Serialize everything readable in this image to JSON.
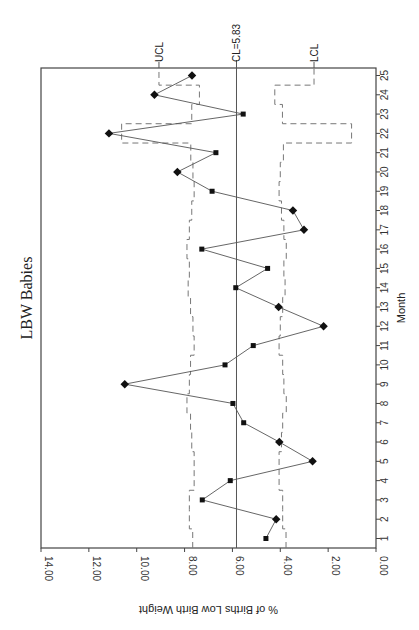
{
  "chart_data": {
    "type": "line",
    "subtype": "p-chart control chart (rotated 90 degrees)",
    "title": "LBW Babies",
    "xlabel": "Month",
    "ylabel": "% of Births Low Birth Weight",
    "x": [
      1,
      2,
      3,
      4,
      5,
      6,
      7,
      8,
      9,
      10,
      11,
      12,
      13,
      14,
      15,
      16,
      17,
      18,
      19,
      20,
      21,
      22,
      23,
      24,
      25
    ],
    "x_tick_labels": [
      "1",
      "2",
      "3",
      "4",
      "5",
      "6",
      "7",
      "8",
      "9",
      "10",
      "11",
      "12",
      "13",
      "14",
      "15",
      "16",
      "17",
      "18",
      "19",
      "20",
      "21",
      "22",
      "23",
      "24",
      "25"
    ],
    "ylim": [
      0,
      14
    ],
    "y_tick_values": [
      0,
      2,
      4,
      6,
      8,
      10,
      12,
      14
    ],
    "y_tick_labels": [
      "0.00",
      "2.00",
      "4.00",
      "6.00",
      "8.00",
      "10.00",
      "12.00",
      "14.00"
    ],
    "grid": false,
    "legend": null,
    "series": [
      {
        "name": "% LBW",
        "values": [
          4.6,
          4.17,
          7.26,
          6.09,
          2.65,
          4.04,
          5.53,
          5.98,
          10.5,
          6.31,
          5.13,
          2.19,
          4.07,
          5.86,
          4.53,
          7.28,
          3.01,
          3.47,
          6.85,
          8.3,
          6.69,
          11.16,
          5.55,
          9.26,
          7.69
        ]
      },
      {
        "name": "UCL",
        "style": "dashed-step",
        "values": [
          7.66,
          7.8,
          7.8,
          7.6,
          7.6,
          7.7,
          7.75,
          7.9,
          7.8,
          7.75,
          7.6,
          7.65,
          7.75,
          7.85,
          7.8,
          7.9,
          7.8,
          7.7,
          7.6,
          7.65,
          7.74,
          10.63,
          7.7,
          7.38,
          9.07
        ]
      },
      {
        "name": "LCL",
        "style": "dashed-step",
        "values": [
          3.76,
          3.9,
          3.9,
          4.05,
          4.05,
          3.95,
          3.9,
          3.75,
          3.85,
          3.9,
          4.05,
          4.0,
          3.9,
          3.8,
          3.85,
          3.75,
          3.85,
          3.95,
          4.05,
          4.0,
          3.87,
          1.02,
          3.91,
          4.23,
          2.59
        ]
      }
    ],
    "center_line": {
      "value": 5.83,
      "label": "CL=5.83"
    },
    "limit_labels": {
      "ucl": "UCL",
      "lcl": "LCL"
    },
    "orientation": "rotated-clockwise"
  }
}
